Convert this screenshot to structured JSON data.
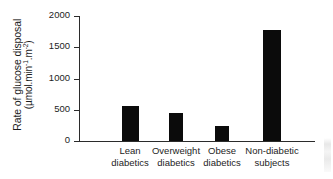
{
  "chart_data": {
    "type": "bar",
    "title": "",
    "xlabel": "",
    "ylabel": "Rate of glucose disposal (µmol.min⁻¹.m⁻²)",
    "ylabel_line1": "Rate of glucose disposal",
    "ylabel_units_prefix": "(µmol.min",
    "ylabel_units_sup1": "-1",
    "ylabel_units_mid": ".m",
    "ylabel_units_sup2": "-2",
    "ylabel_units_suffix": ")",
    "categories": [
      "Lean diabetics",
      "Overweight diabetics",
      "Obese diabetics",
      "Non-diabetic subjects"
    ],
    "category_lines": [
      [
        "Lean",
        "diabetics"
      ],
      [
        "Overweight",
        "diabetics"
      ],
      [
        "Obese",
        "diabetics"
      ],
      [
        "Non-diabetic",
        "subjects"
      ]
    ],
    "values": [
      560,
      450,
      240,
      1775
    ],
    "ylim": [
      0,
      2000
    ],
    "yticks": [
      0,
      500,
      1000,
      1500,
      2000
    ],
    "ytick_labels": [
      "0",
      "500",
      "1000",
      "1500",
      "2000"
    ],
    "grid": false,
    "legend": null,
    "bar_color": "#0b0b0b",
    "axis_color": "#2b2b2b",
    "background_color": "#ffffff"
  }
}
